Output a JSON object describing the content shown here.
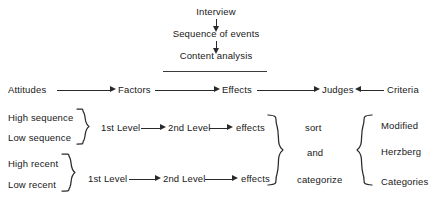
{
  "diagram": {
    "title_flow": {
      "steps": [
        {
          "id": "interview",
          "label": "Interview"
        },
        {
          "id": "sequence-of-events",
          "label": "Sequence of events"
        },
        {
          "id": "content-analysis",
          "label": "Content analysis"
        }
      ]
    },
    "main_chain": {
      "nodes": [
        {
          "id": "attitudes",
          "label": "Attitudes"
        },
        {
          "id": "factors",
          "label": "Factors"
        },
        {
          "id": "effects",
          "label": "Effects"
        },
        {
          "id": "judges",
          "label": "Judges"
        },
        {
          "id": "criteria",
          "label": "Criteria"
        }
      ],
      "arrows": [
        {
          "from": "attitudes",
          "to": "factors",
          "direction": "right"
        },
        {
          "from": "factors",
          "to": "effects",
          "direction": "right"
        },
        {
          "from": "effects",
          "to": "judges",
          "direction": "right"
        },
        {
          "from": "criteria",
          "to": "judges",
          "direction": "left"
        }
      ]
    },
    "branches": [
      {
        "id": "sequence",
        "inputs": [
          "High  sequence",
          "Low  sequence"
        ],
        "steps": [
          "1st Level",
          "2nd Level",
          "effects"
        ]
      },
      {
        "id": "recent",
        "inputs": [
          "High recent",
          "Low recent"
        ],
        "steps": [
          "1st Level",
          "2nd Level",
          "effects"
        ]
      }
    ],
    "action_column": {
      "items": [
        "sort",
        "and",
        "categorize"
      ]
    },
    "output_column": {
      "items": [
        "Modified",
        "Herzberg",
        "Categories"
      ]
    },
    "colors": {
      "ink": "#181818",
      "line": "#2a2a2a",
      "background": "#ffffff"
    }
  }
}
